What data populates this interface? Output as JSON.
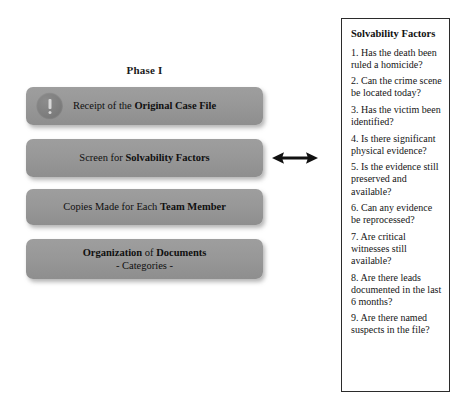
{
  "diagram": {
    "phase_title": "Phase I",
    "boxes": [
      {
        "id": "receipt-original-case-file",
        "icon": "alert-circle-icon",
        "text_plain": "Receipt of the Original Case File",
        "text_html": "Receipt of the <b>Original Case File</b>"
      },
      {
        "id": "screen-solvability-factors",
        "text_plain": "Screen for Solvability Factors",
        "text_html": "Screen for <b>Solvability Factors</b>"
      },
      {
        "id": "copies-each-team-member",
        "text_plain": "Copies Made for Each Team Member",
        "text_html": "Copies Made for Each <b>Team Member</b>"
      },
      {
        "id": "organization-of-documents",
        "text_plain": "Organization of Documents - Categories -",
        "text_html": "<b>Organization</b> of <b>Documents</b><br>- Categories -"
      }
    ],
    "connector": {
      "icon": "double-headed-arrow-icon",
      "color": "#111111"
    },
    "box_color": "#989898"
  },
  "panel": {
    "title": "Solvability Factors",
    "border_color": "#2b2b2b",
    "factors": [
      "1. Has the death been ruled a homicide?",
      "2. Can the crime scene be located today?",
      "3. Has the victim been identified?",
      "4. Is there significant physical evidence?",
      "5. Is the evidence still preserved and available?",
      "6. Can any evidence be reprocessed?",
      "7. Are critical witnesses still available?",
      "8. Are there leads documented in the last 6 months?",
      "9. Are there named suspects in the file?"
    ]
  }
}
